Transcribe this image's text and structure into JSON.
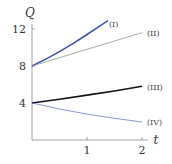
{
  "chart_data": {
    "type": "line",
    "title": "",
    "xlabel": "t",
    "ylabel": "Q",
    "xlim": [
      0,
      2.1
    ],
    "ylim": [
      0,
      13
    ],
    "x_ticks": [
      1,
      2
    ],
    "y_ticks": [
      4,
      8,
      12
    ],
    "grid": false,
    "legend": "inline labels at curve ends",
    "series": [
      {
        "name": "(I)",
        "color": "#3a4fa8",
        "width": 1.5,
        "x": [
          0,
          0.25,
          0.5,
          0.75,
          1.0,
          1.25,
          1.38
        ],
        "values": [
          8,
          8.75,
          9.55,
          10.45,
          11.4,
          12.4,
          12.9
        ]
      },
      {
        "name": "(II)",
        "color": "#8a9a8a",
        "width": 0.8,
        "x": [
          0,
          0.5,
          1.0,
          1.5,
          2.0
        ],
        "values": [
          8,
          8.9,
          9.8,
          10.7,
          11.6
        ]
      },
      {
        "name": "(III)",
        "color": "#111111",
        "width": 1.6,
        "x": [
          0,
          0.5,
          1.0,
          1.5,
          2.0
        ],
        "values": [
          4,
          4.4,
          4.85,
          5.3,
          5.8
        ]
      },
      {
        "name": "(IV)",
        "color": "#6b7bc4",
        "width": 0.8,
        "x": [
          0,
          0.5,
          1.0,
          1.5,
          2.0
        ],
        "values": [
          4,
          3.35,
          2.8,
          2.35,
          1.95
        ]
      }
    ]
  },
  "labels": {
    "y_axis": "Q",
    "x_axis": "t",
    "y_tick_4": "4",
    "y_tick_8": "8",
    "y_tick_12": "12",
    "x_tick_1": "1",
    "x_tick_2": "2",
    "curve_1": "(I)",
    "curve_2": "(II)",
    "curve_3": "(III)",
    "curve_4": "(IV)"
  }
}
